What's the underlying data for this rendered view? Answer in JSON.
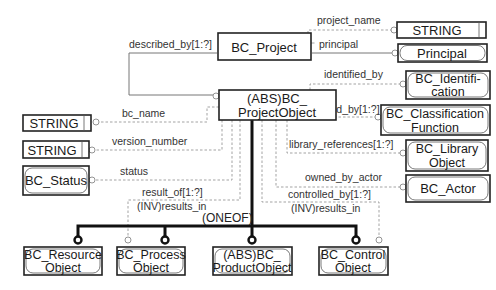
{
  "diagram": {
    "type": "EXPRESS-G",
    "entities": {
      "bc_project": {
        "label": "BC_Project"
      },
      "project_object": {
        "line1": "(ABS)BC_",
        "line2": "ProjectObject"
      },
      "string_project_name": {
        "label": "STRING"
      },
      "principal": {
        "label": "Principal"
      },
      "identification": {
        "line1": "BC_Identifi-",
        "line2": "cation"
      },
      "classification": {
        "line1": "BC_Classification",
        "line2": "Function"
      },
      "library_object": {
        "line1": "BC_Library",
        "line2": "Object"
      },
      "actor": {
        "label": "BC_Actor"
      },
      "string_bc_name": {
        "label": "STRING"
      },
      "string_version": {
        "label": "STRING"
      },
      "status": {
        "label": "BC_Status"
      },
      "resource_object": {
        "line1": "BC_Resource",
        "line2": "Object"
      },
      "process_object": {
        "line1": "BC_Process",
        "line2": "Object"
      },
      "product_object": {
        "line1": "(ABS)BC_",
        "line2": "ProductObject"
      },
      "control_object": {
        "line1": "BC_Control",
        "line2": "Object"
      }
    },
    "relations": {
      "project_name": "project_name",
      "principal": "principal",
      "described_by": "described_by[1:?]",
      "identified_by": "identified_by",
      "classified_by": "classified_by[1:?]",
      "library_references": "library_references[1:?]",
      "owned_by_actor": "owned_by_actor",
      "bc_name": "bc_name",
      "version_number": "version_number",
      "status": "status",
      "result_of": "result_of[1:?]",
      "results_in_left": "(INV)results_in",
      "controlled_by": "controlled_by[1:?]",
      "results_in_right": "(INV)results_in",
      "oneof": "(ONEOF)"
    }
  }
}
